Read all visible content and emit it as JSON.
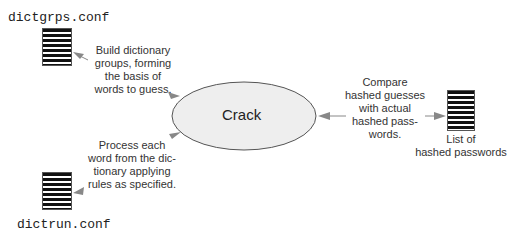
{
  "files": {
    "dictgrps": "dictgrps.conf",
    "dictrun": "dictrun.conf",
    "hashed": "List of\nhashed passwords"
  },
  "hashed_label_lines": [
    "List of",
    "hashed passwords"
  ],
  "center": {
    "label": "Crack",
    "fill": "#eeeeee"
  },
  "notes": {
    "build": [
      "Build dictionary",
      "groups, forming",
      "the basis of",
      "words to guess."
    ],
    "process": [
      "Process each",
      "word from the dic-",
      "tionary applying",
      "rules as specified."
    ],
    "compare": [
      "Compare",
      "hashed guesses",
      "with actual",
      "hashed pass-",
      "words."
    ]
  },
  "colors": {
    "arrow": "#888888",
    "outline": "#555555",
    "doc_lines": "#111111"
  }
}
